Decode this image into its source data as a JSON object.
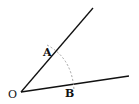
{
  "diagram": {
    "type": "angle construction",
    "points": {
      "O": {
        "label": "O"
      },
      "A": {
        "label": "A"
      },
      "B": {
        "label": "B"
      }
    },
    "colors": {
      "line": "#111111",
      "arc": "#999999"
    }
  }
}
